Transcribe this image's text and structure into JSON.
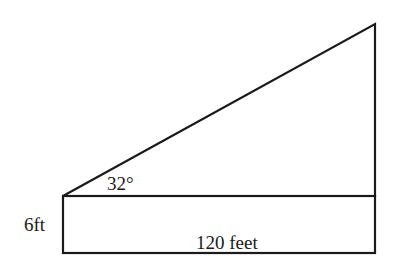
{
  "diagram": {
    "type": "geometry-figure",
    "stroke_color": "#1a1a1a",
    "labels": {
      "angle": "32°",
      "height": "6ft",
      "base": "120 feet"
    },
    "shapes": {
      "triangle": {
        "vertices": [
          [
            63,
            196
          ],
          [
            375,
            196
          ],
          [
            375,
            24
          ]
        ]
      },
      "rectangle": {
        "x": 63,
        "y": 196,
        "width": 312,
        "height": 57
      }
    }
  }
}
